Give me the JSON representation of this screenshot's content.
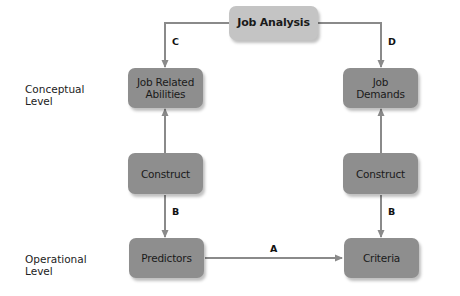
{
  "diagram": {
    "nodes": {
      "job_analysis": "Job Analysis",
      "job_related_abilities": "Job Related\nAbilities",
      "job_demands": "Job\nDemands",
      "construct_left": "Construct",
      "construct_right": "Construct",
      "predictors": "Predictors",
      "criteria": "Criteria"
    },
    "levels": {
      "conceptual": "Conceptual\nLevel",
      "operational": "Operational\nLevel"
    },
    "edge_labels": {
      "a": "A",
      "b_left": "B",
      "b_right": "B",
      "c": "C",
      "d": "D"
    },
    "edges": [
      {
        "from": "job_analysis",
        "to": "job_related_abilities",
        "label": "C"
      },
      {
        "from": "job_analysis",
        "to": "job_demands",
        "label": "D"
      },
      {
        "from": "construct_left",
        "to": "job_related_abilities",
        "label": ""
      },
      {
        "from": "construct_left",
        "to": "predictors",
        "label": "B"
      },
      {
        "from": "construct_right",
        "to": "job_demands",
        "label": ""
      },
      {
        "from": "construct_right",
        "to": "criteria",
        "label": "B"
      },
      {
        "from": "predictors",
        "to": "criteria",
        "label": "A"
      }
    ],
    "colors": {
      "box": "#8e8e8e",
      "top_box": "#c4c4c4",
      "connector": "#8a8a8a"
    }
  }
}
